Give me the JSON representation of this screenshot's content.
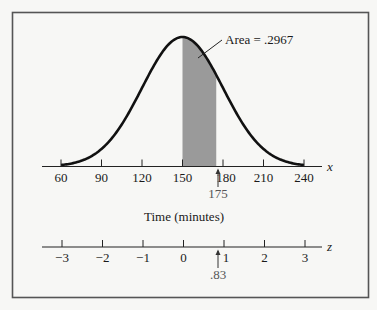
{
  "chart_data": {
    "type": "area",
    "title": "",
    "distribution": "normal",
    "mean": 150,
    "std_dev": 30,
    "shaded_region": {
      "from": 150,
      "to": 175,
      "area": 0.2967
    },
    "annotation": "Area = .2967",
    "x_axis": {
      "label": "Time (minutes)",
      "variable": "x",
      "ticks": [
        60,
        90,
        120,
        150,
        180,
        210,
        240
      ],
      "tick_labels": [
        "60",
        "90",
        "120",
        "150",
        "180",
        "210",
        "240"
      ],
      "marker": {
        "value": 175,
        "label": "175"
      },
      "range": [
        60,
        240
      ]
    },
    "z_axis": {
      "variable": "z",
      "ticks": [
        -3,
        -2,
        -1,
        0,
        1,
        2,
        3
      ],
      "tick_labels": [
        "−3",
        "−2",
        "−1",
        "0",
        "1",
        "2",
        "3"
      ],
      "marker": {
        "value": 0.83,
        "label": ".83"
      },
      "range": [
        -3,
        3
      ]
    },
    "colors": {
      "curve": "#111111",
      "shade": "#9a9a9a",
      "frame": "#555555",
      "background": "#f7f7f5"
    }
  },
  "labels": {
    "annotation": "Area = .2967",
    "x_var": "x",
    "z_var": "z",
    "x_title": "Time (minutes)",
    "x_marker": "175",
    "z_marker": ".83",
    "x_ticks": [
      "60",
      "90",
      "120",
      "150",
      "180",
      "210",
      "240"
    ],
    "z_ticks": [
      "−3",
      "−2",
      "−1",
      "0",
      "1",
      "2",
      "3"
    ]
  }
}
